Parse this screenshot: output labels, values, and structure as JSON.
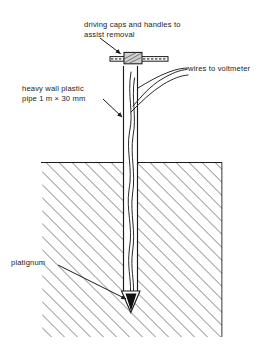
{
  "diagram": {
    "ink_color": "#1b1b1b",
    "ground_hatch_color": "#4a4a4a",
    "electrode_color": "#111111",
    "background": "#ffffff",
    "labels": {
      "driving_caps": "driving caps and handles to\nassist removal",
      "pipe": "heavy wall plastic\npipe 1 m × 30 mm",
      "wires": "wires to voltmeter",
      "platignum": "platignum"
    },
    "parts": {
      "handle_bar": "driving-handle-bar",
      "cap_block": "driving-cap-block",
      "pipe": "heavy-wall-plastic-pipe",
      "inner_wires": "internal-wires",
      "exit_wires": "wires-to-voltmeter",
      "ground": "ground-hatching",
      "ground_line": "ground-surface-line",
      "electrode": "platinum-electrode-tip"
    },
    "geometry": {
      "ground_left": 41,
      "ground_right": 222,
      "ground_top": 162,
      "ground_bottom": 337,
      "pipe_left": 123,
      "pipe_right": 138,
      "pipe_top": 66,
      "pipe_bottom": 292,
      "handle_left": 110,
      "handle_right": 168,
      "handle_y": 59,
      "tip_apex_y": 312,
      "hatch_angle_deg": 45
    }
  }
}
